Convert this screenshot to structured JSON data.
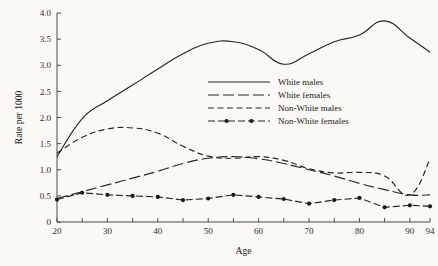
{
  "chart_data": {
    "type": "line",
    "title": "",
    "xlabel": "Age",
    "ylabel": "Rate per 1000",
    "xlim": [
      20,
      94
    ],
    "ylim": [
      0,
      4.0
    ],
    "grid": false,
    "legend_position": "upper-center-right",
    "x_ticks": [
      20,
      25,
      30,
      35,
      40,
      45,
      50,
      55,
      60,
      65,
      70,
      75,
      80,
      85,
      90,
      94
    ],
    "x_tick_labels": [
      "20",
      "",
      "30",
      "",
      "40",
      "",
      "50",
      "",
      "60",
      "",
      "70",
      "",
      "80",
      "",
      "90",
      "94"
    ],
    "y_ticks": [
      0,
      0.5,
      1.0,
      1.5,
      2.0,
      2.5,
      3.0,
      3.5,
      4.0
    ],
    "y_tick_labels": [
      "0",
      "0.5",
      "1.0",
      "1.5",
      "2.0",
      "2.5",
      "3.0",
      "3.5",
      "4.0"
    ],
    "x": [
      20,
      25,
      30,
      35,
      40,
      45,
      50,
      55,
      60,
      65,
      70,
      75,
      80,
      85,
      90,
      94
    ],
    "series": [
      {
        "name": "White males",
        "style": "solid",
        "dash": "",
        "markers": false,
        "values": [
          1.25,
          1.98,
          2.32,
          2.62,
          2.93,
          3.22,
          3.42,
          3.45,
          3.3,
          3.02,
          3.22,
          3.45,
          3.58,
          3.85,
          3.52,
          3.25
        ]
      },
      {
        "name": "White females",
        "style": "long-dash",
        "dash": "11,4",
        "markers": false,
        "values": [
          0.45,
          0.58,
          0.71,
          0.84,
          0.97,
          1.12,
          1.22,
          1.25,
          1.21,
          1.12,
          1.0,
          0.88,
          0.74,
          0.62,
          0.52,
          0.52
        ]
      },
      {
        "name": "Non-White males",
        "style": "medium-dash",
        "dash": "6,3.5",
        "markers": false,
        "values": [
          1.32,
          1.62,
          1.78,
          1.8,
          1.7,
          1.45,
          1.26,
          1.22,
          1.25,
          1.18,
          1.02,
          0.94,
          0.95,
          0.88,
          0.52,
          1.2
        ]
      },
      {
        "name": "Non-White females",
        "style": "dash-dot-marker",
        "dash": "7,3",
        "markers": true,
        "values": [
          0.43,
          0.56,
          0.52,
          0.5,
          0.48,
          0.42,
          0.45,
          0.52,
          0.48,
          0.44,
          0.35,
          0.42,
          0.46,
          0.28,
          0.32,
          0.3
        ]
      }
    ]
  },
  "legend": {
    "entries": [
      {
        "label": "White males"
      },
      {
        "label": "White females"
      },
      {
        "label": "Non-White males"
      },
      {
        "label": "Non-White females"
      }
    ]
  },
  "axes": {
    "x_title": "Age",
    "y_title": "Rate per 1000"
  }
}
